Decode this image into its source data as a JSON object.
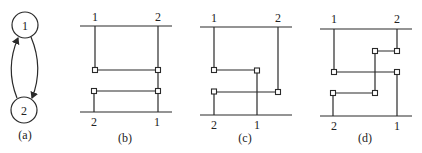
{
  "panels": [
    {
      "id": "a",
      "caption": "(a)",
      "nodes": [
        "1",
        "2"
      ],
      "description": "Two-node directed cycle: 1 -> 2 and 2 -> 1"
    },
    {
      "id": "b",
      "caption": "(b)",
      "top_labels": [
        "1",
        "2"
      ],
      "bottom_labels": [
        "2",
        "1"
      ]
    },
    {
      "id": "c",
      "caption": "(c)",
      "top_labels": [
        "1",
        "2"
      ],
      "bottom_labels": [
        "2",
        "1"
      ]
    },
    {
      "id": "d",
      "caption": "(d)",
      "top_labels": [
        "1",
        "2"
      ],
      "bottom_labels": [
        "2",
        "1"
      ]
    }
  ],
  "colors": {
    "stroke": "#2a2a2a",
    "background": "#ffffff"
  }
}
